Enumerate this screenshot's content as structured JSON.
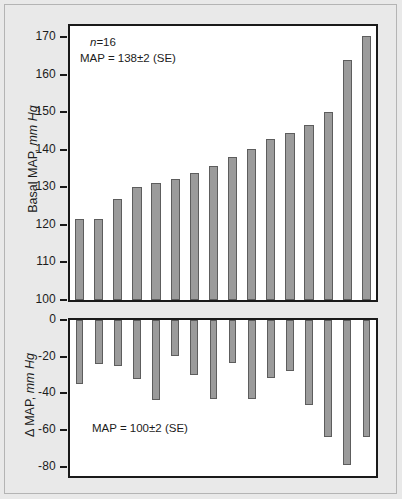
{
  "figure": {
    "background_color": "#e9e9e9",
    "frame_color": "#1a1a1a",
    "bar_fill_color": "#9b9b9b",
    "bar_edge_color": "#5d5d5d"
  },
  "chart_data": [
    {
      "type": "bar",
      "panel": "top",
      "title": "",
      "xlabel": "",
      "ylabel": "Basal MAP, mm Hg",
      "ylabel_plain": "Basal MAP,",
      "ylabel_italic": "mm Hg",
      "ylim": [
        100,
        173
      ],
      "yticks": [
        100,
        110,
        120,
        130,
        140,
        150,
        160,
        170
      ],
      "ytick_labels": [
        "100",
        "110",
        "120",
        "130",
        "140",
        "150",
        "160",
        "170"
      ],
      "grid": false,
      "legend": "none",
      "baseline": 100,
      "categories": [
        "1",
        "2",
        "3",
        "4",
        "5",
        "6",
        "7",
        "8",
        "9",
        "10",
        "11",
        "12",
        "13",
        "14",
        "15",
        "16"
      ],
      "values": [
        121.6,
        121.7,
        126.8,
        130.2,
        131.2,
        132.3,
        133.9,
        135.7,
        138.0,
        140.2,
        142.8,
        144.4,
        146.5,
        150.2,
        164.0,
        170.4
      ],
      "annotations": [
        {
          "text_italic": "n",
          "text": "=16"
        },
        {
          "text": "MAP = 138±2 (SE)"
        }
      ]
    },
    {
      "type": "bar",
      "panel": "bottom",
      "title": "",
      "xlabel": "",
      "ylabel": "Δ MAP, mm Hg",
      "ylabel_plain": "Δ MAP,",
      "ylabel_italic": "mm Hg",
      "ylim": [
        -85,
        0
      ],
      "yticks": [
        0,
        -20,
        -40,
        -60,
        -80
      ],
      "ytick_labels": [
        "0",
        "-20",
        "-40",
        "-60",
        "-80"
      ],
      "grid": false,
      "legend": "none",
      "baseline": 0,
      "categories": [
        "1",
        "2",
        "3",
        "4",
        "5",
        "6",
        "7",
        "8",
        "9",
        "10",
        "11",
        "12",
        "13",
        "14",
        "15",
        "16"
      ],
      "values": [
        -35.0,
        -23.8,
        -25.0,
        -32.0,
        -43.5,
        -19.6,
        -30.2,
        -43.2,
        -23.5,
        -43.0,
        -31.5,
        -28.0,
        -46.2,
        -63.8,
        -79.0,
        -63.8
      ],
      "annotations": [
        {
          "text": "MAP = 100±2 (SE)"
        }
      ]
    }
  ]
}
